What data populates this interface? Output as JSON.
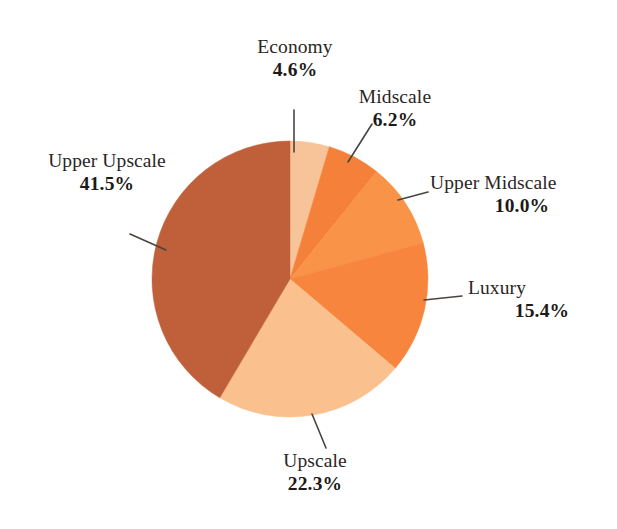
{
  "chart_data": {
    "type": "pie",
    "title": "",
    "subtitle": "",
    "xlabel": "",
    "ylabel": "",
    "legend_position": "none",
    "grid": false,
    "units": "percent",
    "start_angle_deg": 0,
    "direction": "clockwise",
    "categories": [
      "Economy",
      "Midscale",
      "Upper Midscale",
      "Luxury",
      "Upscale",
      "Upper Upscale"
    ],
    "values": [
      4.6,
      6.2,
      10.0,
      15.4,
      22.3,
      41.5
    ],
    "value_labels": [
      "4.6%",
      "6.2%",
      "10.0%",
      "15.4%",
      "22.3%",
      "41.5%"
    ],
    "colors": [
      "#F7C49A",
      "#F4803A",
      "#F89347",
      "#F8853E",
      "#FAC08D",
      "#C0603A"
    ],
    "slices": [
      {
        "label": "Economy",
        "value": 4.6,
        "value_label": "4.6%",
        "color": "#F7C49A"
      },
      {
        "label": "Midscale",
        "value": 6.2,
        "value_label": "6.2%",
        "color": "#F4803A"
      },
      {
        "label": "Upper Midscale",
        "value": 10.0,
        "value_label": "10.0%",
        "color": "#F89347"
      },
      {
        "label": "Luxury",
        "value": 15.4,
        "value_label": "15.4%",
        "color": "#F8853E"
      },
      {
        "label": "Upscale",
        "value": 22.3,
        "value_label": "22.3%",
        "color": "#FAC08D"
      },
      {
        "label": "Upper Upscale",
        "value": 41.5,
        "value_label": "41.5%",
        "color": "#C0603A"
      }
    ]
  },
  "labels": {
    "economy": {
      "category": "Economy",
      "percent": "4.6%"
    },
    "midscale": {
      "category": "Midscale",
      "percent": "6.2%"
    },
    "upper_midscale": {
      "category": "Upper Midscale",
      "percent": "10.0%"
    },
    "luxury": {
      "category": "Luxury",
      "percent": "15.4%"
    },
    "upscale": {
      "category": "Upscale",
      "percent": "22.3%"
    },
    "upper_upscale": {
      "category": "Upper Upscale",
      "percent": "41.5%"
    }
  },
  "style": {
    "background": "#FFFFFF",
    "leader_line_color": "#4A4440",
    "text_color": "#231F20"
  }
}
